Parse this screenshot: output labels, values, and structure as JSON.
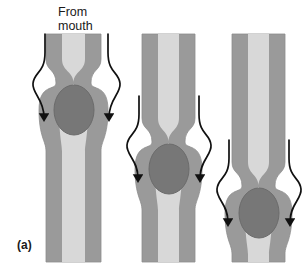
{
  "figure": {
    "domain": "Diagram",
    "panel_letter": "(a)",
    "annotation_label": "From\nmouth",
    "caption_inferred": "Peristaltic wave moving a bolus along a muscular tube",
    "width": 304,
    "height": 269,
    "background_color": "#ffffff"
  },
  "colors": {
    "tube_wall": "#9a9a9a",
    "tube_wall_edge": "#8e8e8e",
    "lumen": "#d8d8d8",
    "bolus": "#777777",
    "bolus_outline": "#6b6b6b",
    "arrow_stroke": "#111111",
    "text": "#1a1a1a"
  },
  "panels": [
    {
      "id": "panel-1",
      "name": "tube-stage-1",
      "description": "Constriction high on the tube, bolus just below the constriction near the top",
      "tube_left": 46,
      "tube_right": 101,
      "wall_thickness": 16,
      "constriction_y": 83,
      "bolus_center_x": 74,
      "bolus_center_y": 110,
      "bolus_rx": 20,
      "bolus_ry": 25,
      "arrow_left": {
        "start_x": 45,
        "start_y": 34,
        "tip_x": 44,
        "tip_y": 117
      },
      "arrow_right": {
        "start_x": 108,
        "start_y": 34,
        "tip_x": 109,
        "tip_y": 117
      }
    },
    {
      "id": "panel-2",
      "name": "tube-stage-2",
      "description": "Constriction at mid height, bolus pushed to middle of the tube",
      "tube_left": 142,
      "tube_right": 195,
      "wall_thickness": 16,
      "constriction_y": 142,
      "bolus_center_x": 169,
      "bolus_center_y": 169,
      "bolus_rx": 20,
      "bolus_ry": 25,
      "arrow_left": {
        "start_x": 139,
        "start_y": 96,
        "tip_x": 138,
        "tip_y": 178
      },
      "arrow_right": {
        "start_x": 199,
        "start_y": 96,
        "tip_x": 200,
        "tip_y": 178
      }
    },
    {
      "id": "panel-3",
      "name": "tube-stage-3",
      "description": "Constriction low on the tube, bolus near the bottom",
      "tube_left": 232,
      "tube_right": 285,
      "wall_thickness": 16,
      "constriction_y": 186,
      "bolus_center_x": 259,
      "bolus_center_y": 213,
      "bolus_rx": 20,
      "bolus_ry": 25,
      "arrow_left": {
        "start_x": 229,
        "start_y": 140,
        "tip_x": 228,
        "tip_y": 222
      },
      "arrow_right": {
        "start_x": 289,
        "start_y": 140,
        "tip_x": 290,
        "tip_y": 222
      }
    }
  ]
}
